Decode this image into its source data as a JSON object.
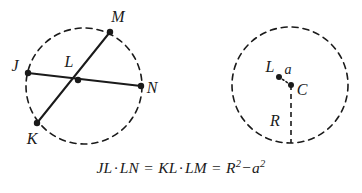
{
  "figure": {
    "background_color": "#ffffff",
    "stroke_color": "#1a1a1a",
    "formula": "JL · LN = KL · LM = R² − a²",
    "formula_parts": {
      "term1_a": "JL",
      "dot1": "·",
      "term1_b": "LN",
      "equals1": "=",
      "term2_a": "KL",
      "dot2": "·",
      "term2_b": "LM",
      "equals2": "=",
      "term3_base1": "R",
      "term3_exp1": "2",
      "minus": "−",
      "term3_base2": "a",
      "term3_exp2": "2"
    }
  },
  "left_circle": {
    "name": "chords-circle",
    "center": {
      "x": 84,
      "y": 86
    },
    "radius": 58,
    "stroke_dasharray": "6 5",
    "points": [
      {
        "id": "J",
        "label": "J",
        "x": 28,
        "y": 73,
        "label_x": 15,
        "label_y": 71
      },
      {
        "id": "M",
        "label": "M",
        "x": 110,
        "y": 32,
        "label_x": 115,
        "label_y": 22
      },
      {
        "id": "L",
        "label": "L",
        "x": 78,
        "y": 80,
        "label_x": 67,
        "label_y": 66
      },
      {
        "id": "N",
        "label": "N",
        "x": 141,
        "y": 86,
        "label_x": 146,
        "label_y": 92
      },
      {
        "id": "K",
        "label": "K",
        "x": 37,
        "y": 123,
        "label_x": 26,
        "label_y": 142
      }
    ],
    "chords": [
      {
        "id": "JN",
        "from": "J",
        "to": "N"
      },
      {
        "id": "KM",
        "from": "K",
        "to": "M"
      }
    ]
  },
  "right_circle": {
    "name": "radius-circle",
    "center": {
      "x": 290,
      "y": 85
    },
    "radius": 58,
    "stroke_dasharray": "6 5",
    "points": [
      {
        "id": "L",
        "label": "L",
        "x": 279,
        "y": 77,
        "label_x": 266,
        "label_y": 72
      },
      {
        "id": "C",
        "label": "C",
        "x": 291,
        "y": 85,
        "label_x": 297,
        "label_y": 94
      }
    ],
    "segments": [
      {
        "id": "a",
        "label": "a",
        "from": "L",
        "to": "C",
        "style": "dotted",
        "label_x": 283,
        "label_y": 74
      },
      {
        "id": "R",
        "label": "R",
        "from": "C",
        "to": "bottom",
        "style": "dashed",
        "label_x": 271,
        "label_y": 124
      }
    ]
  }
}
